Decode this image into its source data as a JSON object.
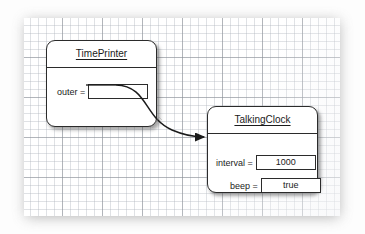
{
  "diagram": {
    "kind": "uml-object-diagram",
    "background_color": "#fdfdfd",
    "paper_color": "#ffffff",
    "grid_minor_color": "#b0b6be",
    "grid_major_color": "#8c9198",
    "line_color": "#2b2b2b",
    "objects": [
      {
        "id": "timeprinter",
        "title": "TimePrinter",
        "fields": [
          {
            "label": "outer =",
            "value": ""
          }
        ]
      },
      {
        "id": "talkingclock",
        "title": "TalkingClock",
        "fields": [
          {
            "label": "interval =",
            "value": "1000"
          },
          {
            "label": "beep =",
            "value": "true"
          }
        ]
      }
    ],
    "connector": {
      "from": "timeprinter.outer",
      "to": "talkingclock",
      "style": "curved-arrow",
      "arrowhead": "filled-triangle"
    }
  }
}
